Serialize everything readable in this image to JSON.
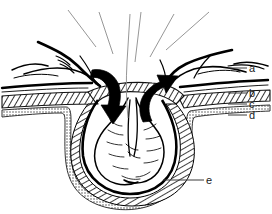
{
  "figure": {
    "type": "anatomical-line-drawing",
    "background_color": "#ffffff",
    "ink_color": "#000000",
    "leader_line_color": "#808080",
    "width": 272,
    "height": 214
  },
  "labels": [
    {
      "key": "a",
      "text": "a",
      "x": 249,
      "y": 63,
      "leader_from_x": 228,
      "leader_from_y": 68
    },
    {
      "key": "b",
      "text": "b",
      "x": 249,
      "y": 88,
      "leader_from_x": 228,
      "leader_from_y": 93
    },
    {
      "key": "c",
      "text": "c",
      "x": 249,
      "y": 99,
      "leader_from_x": 228,
      "leader_from_y": 104
    },
    {
      "key": "d",
      "text": "d",
      "x": 249,
      "y": 110,
      "leader_from_x": 228,
      "leader_from_y": 115
    },
    {
      "key": "e",
      "text": "e",
      "x": 206,
      "y": 175,
      "leader_from_x": 163,
      "leader_from_y": 180
    }
  ],
  "callout_lines": {
    "count": 6,
    "description": "unlabeled thin leader lines rising from the hernia neck to the top edge",
    "lines": [
      {
        "x1": 96,
        "y1": 47,
        "x2": 68,
        "y2": 10
      },
      {
        "x1": 113,
        "y1": 54,
        "x2": 99,
        "y2": 12
      },
      {
        "x1": 127,
        "y1": 60,
        "x2": 130,
        "y2": 14
      },
      {
        "x1": 134,
        "y1": 60,
        "x2": 140,
        "y2": 12
      },
      {
        "x1": 150,
        "y1": 57,
        "x2": 174,
        "y2": 14
      },
      {
        "x1": 165,
        "y1": 50,
        "x2": 209,
        "y2": 12
      }
    ]
  },
  "arrows": [
    {
      "name": "left-arrow-inward",
      "direction": "down-into-sac",
      "style": "solid-black-curved"
    },
    {
      "name": "right-arrow-outward",
      "direction": "up-and-out",
      "style": "solid-black-curved"
    }
  ],
  "layers": [
    {
      "key": "a",
      "render": "outer-soft-tissue-contour"
    },
    {
      "key": "b",
      "render": "thick-solid-line"
    },
    {
      "key": "c",
      "render": "hatched-band"
    },
    {
      "key": "d",
      "render": "stippled-band"
    },
    {
      "key": "e",
      "render": "hernia-sac-outline"
    }
  ]
}
